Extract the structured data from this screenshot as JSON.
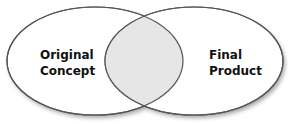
{
  "diagram": {
    "type": "venn",
    "left_set": {
      "label_line1": "Original",
      "label_line2": "Concept"
    },
    "right_set": {
      "label_line1": "Final",
      "label_line2": "Product"
    },
    "intersection": {
      "label": ""
    },
    "colors": {
      "background": "#ffffff",
      "ellipse_fill": "#ffffff",
      "intersection_fill": "#e6e6e6",
      "stroke": "#555555",
      "text": "#111111"
    }
  }
}
